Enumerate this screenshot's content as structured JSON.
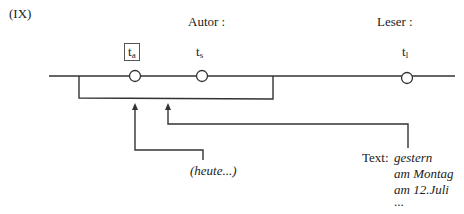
{
  "figure": {
    "label": "(IX)",
    "header_author": "Autor :",
    "header_reader": "Leser :"
  },
  "timeline": {
    "points": [
      {
        "name": "t",
        "sub": "a",
        "boxed": true
      },
      {
        "name": "t",
        "sub": "s",
        "boxed": false
      },
      {
        "name": "t",
        "sub": "l",
        "boxed": false
      }
    ]
  },
  "annotations": {
    "heute": "(heute...)",
    "text_label": "Text:",
    "text_items": [
      "gestern",
      "am Montag",
      "am 12.Juli",
      "..."
    ]
  },
  "colors": {
    "line": "#333333",
    "text": "#222222"
  }
}
